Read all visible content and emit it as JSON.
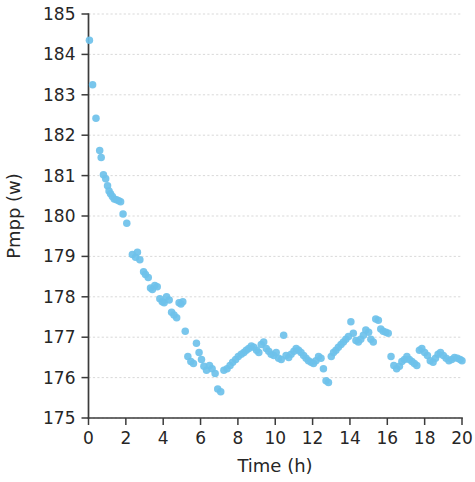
{
  "chart_data": {
    "type": "scatter",
    "title": "",
    "xlabel": "Time (h)",
    "ylabel": "Pmpp (w)",
    "xlim": [
      0,
      20
    ],
    "ylim": [
      175,
      185
    ],
    "xticks": [
      0,
      2,
      4,
      6,
      8,
      10,
      12,
      14,
      16,
      18,
      20
    ],
    "yticks": [
      175,
      176,
      177,
      178,
      179,
      180,
      181,
      182,
      183,
      184,
      185
    ],
    "xtick_labels": [
      "0",
      "2",
      "4",
      "6",
      "8",
      "10",
      "12",
      "14",
      "16",
      "18",
      "20"
    ],
    "ytick_labels": [
      "175",
      "176",
      "177",
      "178",
      "179",
      "180",
      "181",
      "182",
      "183",
      "184",
      "185"
    ],
    "grid": "horizontal",
    "legend": "none",
    "marker_color": "#6ec1ea",
    "marker_size": 7.5,
    "marker_opacity": 0.92,
    "series": [
      {
        "name": "Pmpp",
        "points": [
          [
            0.05,
            184.35
          ],
          [
            0.22,
            183.25
          ],
          [
            0.4,
            182.42
          ],
          [
            0.6,
            181.62
          ],
          [
            0.68,
            181.45
          ],
          [
            0.8,
            181.02
          ],
          [
            0.92,
            180.92
          ],
          [
            1.02,
            180.75
          ],
          [
            1.1,
            180.62
          ],
          [
            1.18,
            180.55
          ],
          [
            1.28,
            180.48
          ],
          [
            1.38,
            180.42
          ],
          [
            1.5,
            180.4
          ],
          [
            1.62,
            180.38
          ],
          [
            1.72,
            180.35
          ],
          [
            1.85,
            180.05
          ],
          [
            2.05,
            179.82
          ],
          [
            2.35,
            179.05
          ],
          [
            2.52,
            178.98
          ],
          [
            2.62,
            179.1
          ],
          [
            2.75,
            178.92
          ],
          [
            2.95,
            178.62
          ],
          [
            3.05,
            178.55
          ],
          [
            3.2,
            178.48
          ],
          [
            3.32,
            178.22
          ],
          [
            3.42,
            178.18
          ],
          [
            3.55,
            178.28
          ],
          [
            3.68,
            178.25
          ],
          [
            3.82,
            177.95
          ],
          [
            3.95,
            177.88
          ],
          [
            4.05,
            177.85
          ],
          [
            4.18,
            178.0
          ],
          [
            4.32,
            177.92
          ],
          [
            4.45,
            177.62
          ],
          [
            4.58,
            177.55
          ],
          [
            4.72,
            177.48
          ],
          [
            4.85,
            177.85
          ],
          [
            4.95,
            177.82
          ],
          [
            5.05,
            177.88
          ],
          [
            5.18,
            177.15
          ],
          [
            5.32,
            176.52
          ],
          [
            5.48,
            176.4
          ],
          [
            5.62,
            176.35
          ],
          [
            5.78,
            176.85
          ],
          [
            5.92,
            176.62
          ],
          [
            6.05,
            176.45
          ],
          [
            6.18,
            176.28
          ],
          [
            6.32,
            176.18
          ],
          [
            6.48,
            176.3
          ],
          [
            6.62,
            176.22
          ],
          [
            6.78,
            176.1
          ],
          [
            6.92,
            175.72
          ],
          [
            7.08,
            175.65
          ],
          [
            7.25,
            176.18
          ],
          [
            7.42,
            176.22
          ],
          [
            7.58,
            176.3
          ],
          [
            7.72,
            176.38
          ],
          [
            7.88,
            176.45
          ],
          [
            8.02,
            176.52
          ],
          [
            8.18,
            176.58
          ],
          [
            8.32,
            176.62
          ],
          [
            8.45,
            176.68
          ],
          [
            8.58,
            176.72
          ],
          [
            8.72,
            176.78
          ],
          [
            8.85,
            176.75
          ],
          [
            9.0,
            176.68
          ],
          [
            9.12,
            176.62
          ],
          [
            9.25,
            176.82
          ],
          [
            9.38,
            176.88
          ],
          [
            9.52,
            176.72
          ],
          [
            9.65,
            176.65
          ],
          [
            9.78,
            176.58
          ],
          [
            9.92,
            176.55
          ],
          [
            10.05,
            176.62
          ],
          [
            10.18,
            176.48
          ],
          [
            10.32,
            176.45
          ],
          [
            10.45,
            177.05
          ],
          [
            10.58,
            176.55
          ],
          [
            10.72,
            176.5
          ],
          [
            10.85,
            176.58
          ],
          [
            11.0,
            176.65
          ],
          [
            11.12,
            176.72
          ],
          [
            11.25,
            176.68
          ],
          [
            11.38,
            176.62
          ],
          [
            11.52,
            176.55
          ],
          [
            11.65,
            176.48
          ],
          [
            11.78,
            176.42
          ],
          [
            11.92,
            176.38
          ],
          [
            12.05,
            176.35
          ],
          [
            12.18,
            176.42
          ],
          [
            12.32,
            176.52
          ],
          [
            12.45,
            176.48
          ],
          [
            12.58,
            176.22
          ],
          [
            12.72,
            175.92
          ],
          [
            12.85,
            175.88
          ],
          [
            13.0,
            176.52
          ],
          [
            13.12,
            176.62
          ],
          [
            13.25,
            176.68
          ],
          [
            13.38,
            176.75
          ],
          [
            13.52,
            176.82
          ],
          [
            13.65,
            176.88
          ],
          [
            13.78,
            176.95
          ],
          [
            13.92,
            177.02
          ],
          [
            14.05,
            177.38
          ],
          [
            14.18,
            177.1
          ],
          [
            14.32,
            176.92
          ],
          [
            14.45,
            176.88
          ],
          [
            14.58,
            176.95
          ],
          [
            14.72,
            177.05
          ],
          [
            14.85,
            177.18
          ],
          [
            15.0,
            177.12
          ],
          [
            15.12,
            176.95
          ],
          [
            15.25,
            176.88
          ],
          [
            15.38,
            177.45
          ],
          [
            15.52,
            177.42
          ],
          [
            15.65,
            177.2
          ],
          [
            15.78,
            177.15
          ],
          [
            15.92,
            177.12
          ],
          [
            16.05,
            177.1
          ],
          [
            16.2,
            176.52
          ],
          [
            16.35,
            176.3
          ],
          [
            16.5,
            176.22
          ],
          [
            16.65,
            176.28
          ],
          [
            16.78,
            176.4
          ],
          [
            16.92,
            176.45
          ],
          [
            17.05,
            176.52
          ],
          [
            17.18,
            176.45
          ],
          [
            17.32,
            176.4
          ],
          [
            17.45,
            176.35
          ],
          [
            17.58,
            176.3
          ],
          [
            17.72,
            176.68
          ],
          [
            17.85,
            176.72
          ],
          [
            18.0,
            176.62
          ],
          [
            18.15,
            176.55
          ],
          [
            18.3,
            176.42
          ],
          [
            18.45,
            176.38
          ],
          [
            18.58,
            176.48
          ],
          [
            18.72,
            176.58
          ],
          [
            18.85,
            176.62
          ],
          [
            19.0,
            176.55
          ],
          [
            19.15,
            176.48
          ],
          [
            19.3,
            176.42
          ],
          [
            19.45,
            176.45
          ],
          [
            19.6,
            176.5
          ],
          [
            19.75,
            176.48
          ],
          [
            19.9,
            176.45
          ],
          [
            20.0,
            176.42
          ]
        ]
      }
    ]
  }
}
